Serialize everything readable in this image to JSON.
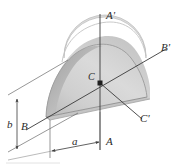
{
  "figure": {
    "type": "engineering-diagram",
    "background_color": "#ffffff"
  },
  "labels": {
    "axis_a_top": "A'",
    "axis_a_bottom": "A",
    "axis_b_left": "B",
    "axis_b_right": "B'",
    "axis_c_center": "C",
    "axis_c_right": "C'",
    "dim_height": "b",
    "dim_width": "a"
  },
  "colors": {
    "line": "#3a3a3a",
    "line_light": "#8a8a8a",
    "body_top": "#d4d4d4",
    "body_face": "#cdcdcd",
    "body_side": "#b4b4b4",
    "body_base": "#c2c2c2",
    "text": "#2b2b2b"
  },
  "geometry": {
    "centroid_px": [
      100,
      83
    ],
    "axis_a_top_px": [
      100,
      14
    ],
    "axis_a_bottom_px": [
      100,
      150
    ],
    "axis_b_left_px": [
      30,
      128
    ],
    "axis_b_right_px": [
      166,
      50
    ],
    "axis_c_right_px": [
      140,
      118
    ]
  }
}
